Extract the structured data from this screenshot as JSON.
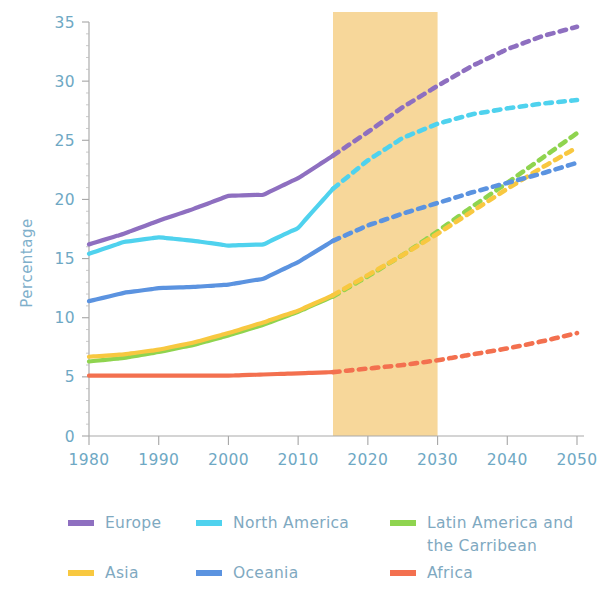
{
  "chart_data": {
    "type": "line",
    "title": "",
    "subtitle": "",
    "xlabel": "",
    "ylabel": "Percentage",
    "xlim": [
      1980,
      2050
    ],
    "ylim": [
      0,
      35
    ],
    "x_ticks": [
      1980,
      1990,
      2000,
      2010,
      2020,
      2030,
      2040,
      2050
    ],
    "y_ticks": [
      0,
      5,
      10,
      15,
      20,
      25,
      30,
      35
    ],
    "grid": false,
    "legend_position": "bottom",
    "projection_band": {
      "label": "",
      "start": 2015,
      "end": 2030,
      "color": "#f7d79a"
    },
    "projection_start_year": 2015,
    "annotations": [],
    "x": [
      1980,
      1985,
      1990,
      1995,
      2000,
      2005,
      2010,
      2015,
      2020,
      2025,
      2030,
      2035,
      2040,
      2045,
      2050
    ],
    "series": [
      {
        "name": "Europe",
        "color": "#8e6fc0",
        "values": [
          16.2,
          17.1,
          18.2,
          19.2,
          20.3,
          20.4,
          21.8,
          23.7,
          25.7,
          27.8,
          29.6,
          31.3,
          32.7,
          33.8,
          34.6
        ]
      },
      {
        "name": "North America",
        "color": "#4fd2ee",
        "values": [
          15.4,
          16.4,
          16.8,
          16.5,
          16.1,
          16.2,
          17.6,
          20.9,
          23.3,
          25.2,
          26.4,
          27.2,
          27.7,
          28.1,
          28.4
        ]
      },
      {
        "name": "Latin America and the Carribean",
        "color": "#8fd44f",
        "values": [
          6.3,
          6.6,
          7.1,
          7.7,
          8.5,
          9.4,
          10.5,
          11.8,
          13.5,
          15.3,
          17.3,
          19.4,
          21.4,
          23.5,
          25.6
        ]
      },
      {
        "name": "Asia",
        "color": "#f8c840",
        "values": [
          6.7,
          6.9,
          7.3,
          7.9,
          8.7,
          9.6,
          10.6,
          11.9,
          13.6,
          15.3,
          17.1,
          19.0,
          20.9,
          22.7,
          24.4
        ]
      },
      {
        "name": "Oceania",
        "color": "#5b93e0",
        "values": [
          11.4,
          12.1,
          12.5,
          12.6,
          12.8,
          13.3,
          14.7,
          16.5,
          17.8,
          18.8,
          19.7,
          20.6,
          21.4,
          22.2,
          23.1
        ]
      },
      {
        "name": "Africa",
        "color": "#f3704f",
        "values": [
          5.1,
          5.1,
          5.1,
          5.1,
          5.1,
          5.2,
          5.3,
          5.4,
          5.7,
          6.0,
          6.4,
          6.9,
          7.4,
          8.0,
          8.7
        ]
      }
    ]
  },
  "axis": {
    "y_title": "Percentage",
    "y_tick_labels": [
      "0",
      "5",
      "10",
      "15",
      "20",
      "25",
      "30",
      "35"
    ],
    "x_tick_labels": [
      "1980",
      "1990",
      "2000",
      "2010",
      "2020",
      "2030",
      "2040",
      "2050"
    ]
  },
  "legend": {
    "items": [
      {
        "label": "Europe",
        "color": "#8e6fc0"
      },
      {
        "label": "North America",
        "color": "#4fd2ee"
      },
      {
        "label": "Latin America and",
        "label2": "the Carribean",
        "color": "#8fd44f"
      },
      {
        "label": "Asia",
        "color": "#f8c840"
      },
      {
        "label": "Oceania",
        "color": "#5b93e0"
      },
      {
        "label": "Africa",
        "color": "#f3704f"
      }
    ]
  },
  "colors": {
    "band": "#f7d79a",
    "tick_text": "#6ea8c4",
    "legend_text": "#7fa9c1",
    "axis": "#a9a9a9"
  }
}
